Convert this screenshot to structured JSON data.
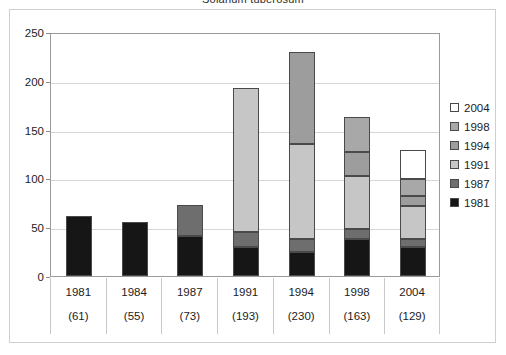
{
  "chart_data": {
    "type": "bar",
    "title": "Solanum tuberosum",
    "xlabel": "",
    "ylabel": "",
    "ylim": [
      0,
      250
    ],
    "yticks": [
      0,
      50,
      100,
      150,
      200,
      250
    ],
    "grid": true,
    "stacked": true,
    "legend_position": "right",
    "categories": [
      "1981",
      "1984",
      "1987",
      "1991",
      "1994",
      "1998",
      "2004"
    ],
    "category_counts": [
      "(61)",
      "(55)",
      "(73)",
      "(193)",
      "(230)",
      "(163)",
      "(129)"
    ],
    "totals": [
      61,
      55,
      73,
      193,
      230,
      163,
      129
    ],
    "series": [
      {
        "name": "1981",
        "color": "#161616",
        "values": [
          61,
          55,
          41,
          30,
          25,
          38,
          30
        ]
      },
      {
        "name": "1987",
        "color": "#6e6e6e",
        "values": [
          0,
          0,
          32,
          15,
          13,
          10,
          8
        ]
      },
      {
        "name": "1991",
        "color": "#c6c6c6",
        "values": [
          0,
          0,
          0,
          148,
          97,
          54,
          34
        ]
      },
      {
        "name": "1994",
        "color": "#9d9d9d",
        "values": [
          0,
          0,
          0,
          0,
          95,
          25,
          10
        ]
      },
      {
        "name": "1998",
        "color": "#a8a8a8",
        "values": [
          0,
          0,
          0,
          0,
          0,
          36,
          17
        ]
      },
      {
        "name": "2004",
        "color": "#ffffff",
        "values": [
          0,
          0,
          0,
          0,
          0,
          0,
          30
        ]
      }
    ],
    "legend_entries": [
      {
        "label": "2004",
        "color": "#ffffff"
      },
      {
        "label": "1998",
        "color": "#a8a8a8"
      },
      {
        "label": "1994",
        "color": "#9d9d9d"
      },
      {
        "label": "1991",
        "color": "#c6c6c6"
      },
      {
        "label": "1987",
        "color": "#6e6e6e"
      },
      {
        "label": "1981",
        "color": "#161616"
      }
    ]
  }
}
